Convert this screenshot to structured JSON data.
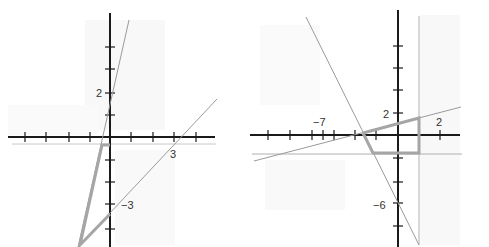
{
  "colors": {
    "axis": "#1a1a1a",
    "thin_line": "#9a9a9a",
    "region": "#a6a6a6",
    "shade": "#eeeeee",
    "label": "#333333"
  },
  "graphs": [
    {
      "name": "left-graph",
      "labels": [
        {
          "text": "2",
          "x": 96,
          "y": 97
        },
        {
          "text": "3",
          "x": 172,
          "y": 158
        },
        {
          "text": "−3",
          "x": 121,
          "y": 209
        }
      ]
    },
    {
      "name": "right-graph",
      "labels": [
        {
          "text": "−7",
          "x": 315,
          "y": 126
        },
        {
          "text": "2",
          "x": 383,
          "y": 117
        },
        {
          "text": "2",
          "x": 436,
          "y": 126
        },
        {
          "text": "−6",
          "x": 374,
          "y": 209
        }
      ]
    }
  ]
}
